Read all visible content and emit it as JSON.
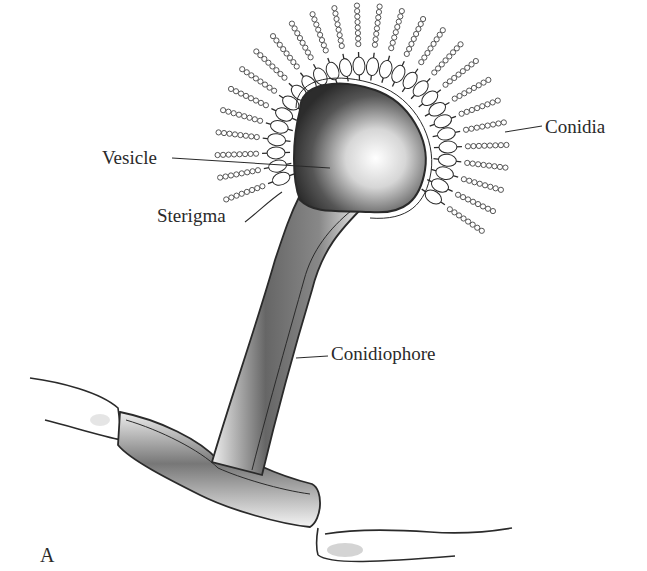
{
  "figure": {
    "panel_label": "A",
    "labels": {
      "vesicle": "Vesicle",
      "sterigma": "Sterigma",
      "conidia": "Conidia",
      "conidiophore": "Conidiophore"
    },
    "colors": {
      "ink": "#2a2a2a",
      "shading": "#3a3a3a",
      "background": "#ffffff"
    }
  }
}
